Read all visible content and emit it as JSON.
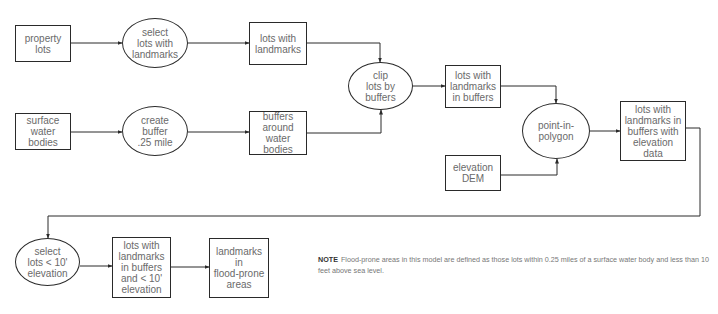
{
  "diagram": {
    "line_color": "#2a2a2a",
    "text_color": "#6a6a6a",
    "nodes": [
      {
        "id": "property_lots",
        "shape": "box",
        "label": "property\nlots",
        "x": 15,
        "y": 25,
        "w": 56,
        "h": 37
      },
      {
        "id": "select_lots_landmarks",
        "shape": "ellipse",
        "label": "select\nlots with\nlandmarks",
        "x": 122,
        "y": 18,
        "w": 66,
        "h": 50
      },
      {
        "id": "lots_with_landmarks",
        "shape": "box",
        "label": "lots with\nlandmarks",
        "x": 249,
        "y": 22,
        "w": 58,
        "h": 43
      },
      {
        "id": "surface_water",
        "shape": "box",
        "label": "surface\nwater bodies",
        "x": 15,
        "y": 113,
        "w": 56,
        "h": 37
      },
      {
        "id": "create_buffer",
        "shape": "ellipse",
        "label": "create\nbuffer\n.25 mile",
        "x": 122,
        "y": 106,
        "w": 66,
        "h": 50
      },
      {
        "id": "buffers_around_water",
        "shape": "box",
        "label": "buffers\naround water\nbodies",
        "x": 249,
        "y": 111,
        "w": 58,
        "h": 44
      },
      {
        "id": "clip_lots",
        "shape": "ellipse",
        "label": "clip\nlots by\nbuffers",
        "x": 348,
        "y": 62,
        "w": 65,
        "h": 48
      },
      {
        "id": "lots_in_buffers",
        "shape": "box",
        "label": "lots with\nlandmarks\nin buffers",
        "x": 445,
        "y": 65,
        "w": 56,
        "h": 43
      },
      {
        "id": "elevation_dem",
        "shape": "box",
        "label": "elevation\nDEM",
        "x": 445,
        "y": 155,
        "w": 56,
        "h": 36
      },
      {
        "id": "point_in_polygon",
        "shape": "ellipse",
        "label": "point-in-\npolygon",
        "x": 522,
        "y": 103,
        "w": 68,
        "h": 56
      },
      {
        "id": "lots_with_elevation",
        "shape": "box",
        "label": "lots with\nlandmarks in\nbuffers with\nelevation data",
        "x": 620,
        "y": 101,
        "w": 66,
        "h": 60
      },
      {
        "id": "select_lots_elevation",
        "shape": "ellipse",
        "label": "select\nlots < 10'\nelevation",
        "x": 15,
        "y": 238,
        "w": 65,
        "h": 48
      },
      {
        "id": "lots_buffers_elevation",
        "shape": "box",
        "label": "lots with\nlandmarks\nin buffers\nand < 10'\nelevation",
        "x": 112,
        "y": 237,
        "w": 59,
        "h": 61
      },
      {
        "id": "flood_prone_landmarks",
        "shape": "box",
        "label": "landmarks in\nflood-prone\nareas",
        "x": 209,
        "y": 238,
        "w": 60,
        "h": 60
      }
    ],
    "edges": [
      {
        "from": "property_lots",
        "to": "select_lots_landmarks",
        "points": [
          [
            71,
            43
          ],
          [
            122,
            43
          ]
        ]
      },
      {
        "from": "select_lots_landmarks",
        "to": "lots_with_landmarks",
        "points": [
          [
            188,
            43
          ],
          [
            249,
            43
          ]
        ]
      },
      {
        "from": "lots_with_landmarks",
        "to": "clip_lots",
        "points": [
          [
            307,
            43
          ],
          [
            380,
            43
          ],
          [
            380,
            62
          ]
        ]
      },
      {
        "from": "surface_water",
        "to": "create_buffer",
        "points": [
          [
            71,
            132
          ],
          [
            122,
            132
          ]
        ]
      },
      {
        "from": "create_buffer",
        "to": "buffers_around_water",
        "points": [
          [
            188,
            132
          ],
          [
            249,
            132
          ]
        ]
      },
      {
        "from": "buffers_around_water",
        "to": "clip_lots",
        "points": [
          [
            307,
            133
          ],
          [
            381,
            133
          ],
          [
            381,
            110
          ]
        ]
      },
      {
        "from": "clip_lots",
        "to": "lots_in_buffers",
        "points": [
          [
            413,
            86
          ],
          [
            445,
            86
          ]
        ]
      },
      {
        "from": "lots_in_buffers",
        "to": "point_in_polygon",
        "points": [
          [
            501,
            86
          ],
          [
            556,
            86
          ],
          [
            556,
            103
          ]
        ]
      },
      {
        "from": "elevation_dem",
        "to": "point_in_polygon",
        "points": [
          [
            501,
            175
          ],
          [
            557,
            175
          ],
          [
            557,
            159
          ]
        ]
      },
      {
        "from": "point_in_polygon",
        "to": "lots_with_elevation",
        "points": [
          [
            590,
            131
          ],
          [
            620,
            131
          ]
        ]
      },
      {
        "from": "lots_with_elevation",
        "to": "select_lots_elevation",
        "points": [
          [
            686,
            128
          ],
          [
            700,
            128
          ],
          [
            700,
            216
          ],
          [
            48,
            216
          ],
          [
            48,
            238
          ]
        ]
      },
      {
        "from": "select_lots_elevation",
        "to": "lots_buffers_elevation",
        "points": [
          [
            80,
            266
          ],
          [
            112,
            266
          ]
        ]
      },
      {
        "from": "lots_buffers_elevation",
        "to": "flood_prone_landmarks",
        "points": [
          [
            171,
            267
          ],
          [
            209,
            267
          ]
        ]
      }
    ]
  },
  "note": {
    "label": "NOTE",
    "text": "Flood-prone areas in this model are defined as those lots within 0.25 miles of a surface water body and less than 10 feet above sea level."
  }
}
